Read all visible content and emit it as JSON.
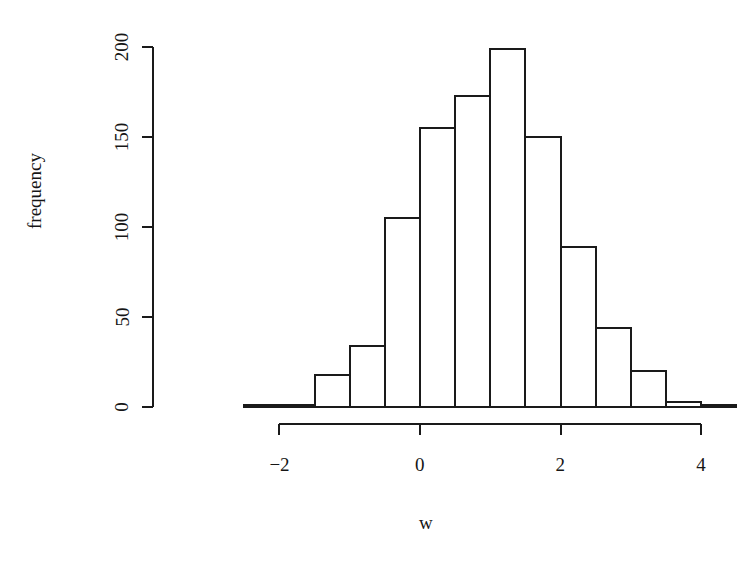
{
  "chart_data": {
    "type": "bar",
    "subtype": "histogram",
    "title": "",
    "subtitle": "",
    "xlabel": "w",
    "ylabel": "frequency",
    "xlim": [
      -2.7,
      4.3
    ],
    "ylim": [
      0,
      205
    ],
    "grid": false,
    "legend": null,
    "bin_width": 0.5,
    "bin_edges": [
      -2.5,
      -2.0,
      -1.5,
      -1.0,
      -0.5,
      0.0,
      0.5,
      1.0,
      1.5,
      2.0,
      2.5,
      3.0,
      3.5,
      4.0,
      4.5
    ],
    "categories": [
      "-2.5 to -2.0",
      "-2.0 to -1.5",
      "-1.5 to -1.0",
      "-1.0 to -0.5",
      "-0.5 to 0.0",
      "0.0 to 0.5",
      "0.5 to 1.0",
      "1.0 to 1.5",
      "1.5 to 2.0",
      "2.0 to 2.5",
      "2.5 to 3.0",
      "3.0 to 3.5",
      "3.5 to 4.0",
      "4.0 to 4.5"
    ],
    "values": [
      1,
      1,
      18,
      34,
      105,
      155,
      173,
      199,
      150,
      89,
      44,
      20,
      3,
      1
    ],
    "xticks": [
      -2,
      0,
      2,
      4
    ],
    "xtick_labels": [
      "−2",
      "0",
      "2",
      "4"
    ],
    "yticks": [
      0,
      50,
      100,
      150,
      200
    ],
    "ytick_labels": [
      "0",
      "50",
      "100",
      "150",
      "200"
    ],
    "bar_fill": "#ffffff",
    "bar_stroke": "#1a1a1a",
    "axis_color": "#1a1a1a",
    "background": "#ffffff"
  }
}
